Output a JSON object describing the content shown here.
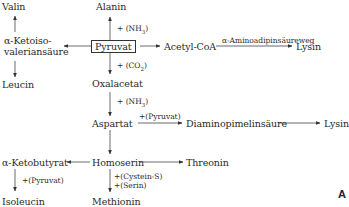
{
  "diagram": {
    "title": "",
    "nodes": {
      "valin": "Valin",
      "alanin": "Alanin",
      "ketoiso_line1": "α-Ketoiso-",
      "ketoiso_line2": "valeriansäure",
      "pyruvat": "Pyruvat",
      "acetyl_coa": "Acetyl-CoA",
      "lysin_top": "Lysin",
      "leucin": "Leucin",
      "oxalacetat": "Oxalacetat",
      "aspartat": "Aspartat",
      "diaminopimelinsaeure": "Diaminopimelinsäure",
      "lysin_mid": "Lysin",
      "ketobutyrat": "α-Ketobutyrat",
      "homoserin": "Homoserin",
      "threonin": "Threonin",
      "isoleucin": "Isoleucin",
      "methionin": "Methionin"
    },
    "edge_labels": {
      "nh3_alanin": "+ (NH3)",
      "co2": "+ (CO2)",
      "nh3_aspartat": "+ (NH3)",
      "aminoadipin": "α-Aminoadipinsäureweg",
      "pyruvat_dap": "+(Pyruvat)",
      "pyruvat_ile": "+(Pyruvat)",
      "cystein": "+(Cystein-S)",
      "serin": "+(Serin)"
    },
    "corner_label": "A"
  }
}
